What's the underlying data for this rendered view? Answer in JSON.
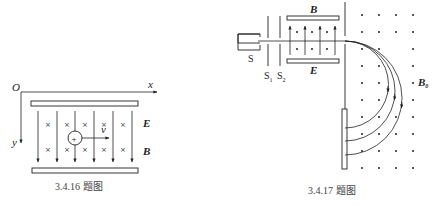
{
  "figures": [
    {
      "id": "fig1",
      "caption": "3.4.16 题图",
      "labels": {
        "origin": "O",
        "x_axis": "x",
        "y_axis": "y",
        "electric_field": "E",
        "magnetic_field": "B",
        "velocity": "v",
        "charge": "+"
      },
      "field_symbol_into_page": "×"
    },
    {
      "id": "fig2",
      "caption": "3.4.17 题图",
      "labels": {
        "source": "S",
        "slit1": "S",
        "slit1_sub": "1",
        "slit2": "S",
        "slit2_sub": "2",
        "selector_magnetic": "B",
        "selector_electric": "E",
        "deflect_magnetic": "B",
        "deflect_magnetic_sub": "0"
      }
    }
  ]
}
